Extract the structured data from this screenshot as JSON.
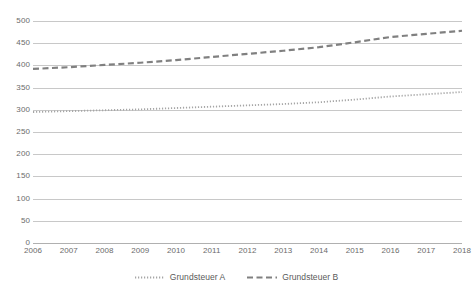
{
  "chart_data": {
    "type": "line",
    "title": "",
    "subtitle": "",
    "xlabel": "",
    "ylabel": "",
    "x": [
      2006,
      2007,
      2008,
      2009,
      2010,
      2011,
      2012,
      2013,
      2014,
      2015,
      2016,
      2017,
      2018
    ],
    "categories": [
      "2006",
      "2007",
      "2008",
      "2009",
      "2010",
      "2011",
      "2012",
      "2013",
      "2014",
      "2015",
      "2016",
      "2017",
      "2018"
    ],
    "series": [
      {
        "name": "Grundsteuer A",
        "line_style": "dotted",
        "color": "#a6a6a6",
        "values": [
          295,
          297,
          299,
          301,
          304,
          307,
          310,
          313,
          317,
          323,
          330,
          335,
          340
        ]
      },
      {
        "name": "Grundsteuer B",
        "line_style": "dashed",
        "color": "#808080",
        "values": [
          392,
          396,
          401,
          406,
          412,
          419,
          426,
          433,
          441,
          452,
          464,
          471,
          478
        ]
      }
    ],
    "ylim": [
      0,
      500
    ],
    "xlim": [
      2006,
      2018
    ],
    "y_ticks": [
      0,
      50,
      100,
      150,
      200,
      250,
      300,
      350,
      400,
      450,
      500
    ],
    "y_tick_labels": [
      "0",
      "50",
      "100",
      "150",
      "200",
      "250",
      "300",
      "350",
      "400",
      "450",
      "500"
    ],
    "grid": true,
    "grid_axis": "y",
    "legend_position": "bottom"
  },
  "legend": {
    "items": [
      {
        "label": "Grundsteuer A",
        "style": "dotted",
        "color": "#a6a6a6"
      },
      {
        "label": "Grundsteuer B",
        "style": "dashed",
        "color": "#808080"
      }
    ]
  },
  "colors": {
    "gridline": "#c8c8c8",
    "baseline": "#b0b0b0",
    "tick_text": "#6b6b6b",
    "legend_text": "#5a5a5a",
    "background": "#ffffff"
  }
}
